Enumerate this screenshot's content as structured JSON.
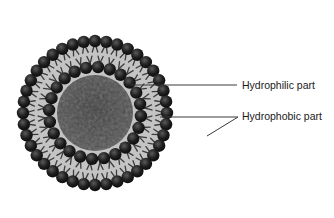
{
  "diagram": {
    "labels": {
      "hydrophilic": "Hydrophilic part",
      "hydrophobic": "Hydrophobic part"
    },
    "colors": {
      "background": "#ffffff",
      "head": "#1e1e1e",
      "head_highlight": "#5a5a5a",
      "tail": "#3c3c3c",
      "bilayer_fill": "#c4c4c4",
      "core": "#4a4a4a",
      "leader_line": "#3a3a3a",
      "text": "#1a1a1a"
    },
    "geometry": {
      "center": [
        95,
        113
      ],
      "outer_head_radius": 74,
      "outer_head_count": 40,
      "inner_head_radius": 46,
      "inner_head_count": 24,
      "core_radius": 38,
      "head_size": 6.2
    }
  }
}
